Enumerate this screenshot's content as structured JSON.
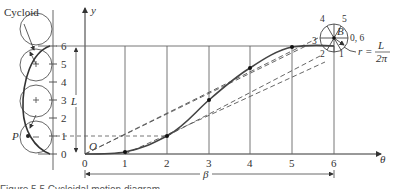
{
  "diagram": {
    "title_label": "Cycloid",
    "y_axis_label": "y",
    "x_axis_label": "θ",
    "origin_label": "O",
    "point_p_label": "P",
    "point_b_label": "B",
    "length_label": "L",
    "beta_label": "β",
    "radius_label": "r =",
    "radius_numerator": "L",
    "radius_denominator": "2π",
    "x_ticks": [
      "0",
      "1",
      "2",
      "3",
      "4",
      "5",
      "6"
    ],
    "left_scale_ticks": [
      "0",
      "1",
      "2",
      "3",
      "4",
      "5",
      "6"
    ],
    "circle_positions": [
      "0, 6",
      "1",
      "2",
      "3",
      "4",
      "5"
    ],
    "caption_fragment": "Figure 5.5  Cycloidal motion diagram"
  }
}
